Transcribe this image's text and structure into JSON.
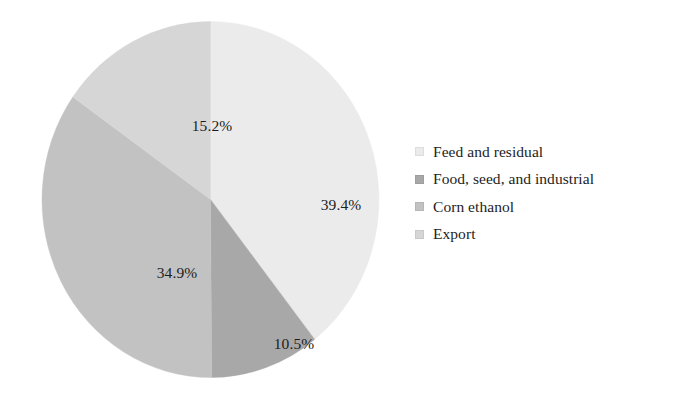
{
  "chart_data": {
    "type": "pie",
    "title": "",
    "subtitle": "",
    "xlabel": "",
    "ylabel": "",
    "grid": false,
    "legend_position": "right",
    "start_angle_deg": 0,
    "direction": "clockwise",
    "categories": [
      "Feed and residual",
      "Food, seed, and industrial",
      "Corn ethanol",
      "Export"
    ],
    "values": [
      39.4,
      10.5,
      34.9,
      15.2
    ],
    "value_labels": [
      "39.4%",
      "10.5%",
      "34.9%",
      "15.2%"
    ],
    "slice_colors": [
      "#ebebeb",
      "#a8a8a8",
      "#c2c2c2",
      "#d6d6d6"
    ],
    "slices": [
      {
        "name": "Feed and residual",
        "value": 39.4,
        "label": "39.4%",
        "color": "#ebebeb",
        "start_angle_deg": 0,
        "end_angle_deg": 141.8
      },
      {
        "name": "Food, seed, and industrial",
        "value": 10.5,
        "label": "10.5%",
        "color": "#a8a8a8",
        "start_angle_deg": 141.8,
        "end_angle_deg": 179.6
      },
      {
        "name": "Corn ethanol",
        "value": 34.9,
        "label": "34.9%",
        "color": "#c2c2c2",
        "start_angle_deg": 179.6,
        "end_angle_deg": 305.2
      },
      {
        "name": "Export",
        "value": 15.2,
        "label": "15.2%",
        "color": "#d6d6d6",
        "start_angle_deg": 305.2,
        "end_angle_deg": 360
      }
    ]
  },
  "legend": {
    "items": [
      {
        "label": "Feed and residual",
        "color": "#ebebeb"
      },
      {
        "label": "Food, seed, and industrial",
        "color": "#a8a8a8"
      },
      {
        "label": "Corn ethanol",
        "color": "#c2c2c2"
      },
      {
        "label": "Export",
        "color": "#d6d6d6"
      }
    ]
  }
}
